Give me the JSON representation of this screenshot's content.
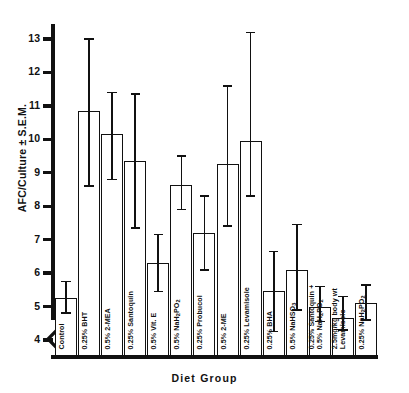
{
  "chart_data": {
    "type": "bar",
    "title": "",
    "xlabel": "Diet Group",
    "ylabel": "AFC/Culture ± S.E.M.",
    "ylim": [
      3.55,
      13.45
    ],
    "yticks": [
      4,
      5,
      6,
      7,
      8,
      9,
      10,
      11,
      12,
      13
    ],
    "ytick_labels": [
      "4",
      "5",
      "6",
      "7",
      "8",
      "9",
      "10",
      "11",
      "12",
      "13"
    ],
    "axis_break": true,
    "grid": false,
    "legend": "none",
    "error_type": "S.E.M.",
    "categories": [
      "Control",
      "0.25% BHT",
      "0.5% 2-MEA",
      "0.25% Santoquin",
      "0.5% Vit. E",
      "0.5% NaH2PO2",
      "0.25% Probucol",
      "0.5% 2-ME",
      "0.25% Levamisole",
      "0.25% BHA",
      "0.5% NaHSO3",
      "0.25% Santoquin +\n0.5% NaH2PO2",
      "2.5mg/kg body wt\nLevamisole",
      "0.25% NaH2PO2"
    ],
    "values": [
      5.25,
      10.85,
      10.15,
      9.35,
      6.3,
      8.65,
      7.2,
      9.25,
      9.95,
      5.45,
      6.1,
      5.0,
      4.65,
      5.1
    ],
    "err_low": [
      4.8,
      8.6,
      8.8,
      7.35,
      5.45,
      7.9,
      6.1,
      7.4,
      8.3,
      4.25,
      4.9,
      4.55,
      4.3,
      4.6
    ],
    "err_high": [
      5.75,
      13.0,
      11.4,
      11.35,
      7.15,
      9.5,
      8.3,
      11.6,
      13.2,
      6.65,
      7.45,
      5.6,
      5.3,
      5.65
    ]
  },
  "axis": {
    "y_axis_name": "y-axis",
    "x_axis_name": "x-axis",
    "break_symbol": "axis-break"
  }
}
